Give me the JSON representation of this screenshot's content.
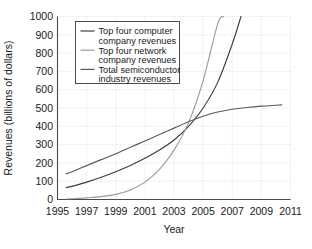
{
  "chart_data": {
    "type": "line",
    "title": "",
    "xlabel": "Year",
    "ylabel": "Revenues (billions of dollars)",
    "xlim": [
      1995,
      2011
    ],
    "ylim": [
      0,
      1000
    ],
    "xticks": [
      1995,
      1997,
      1999,
      2001,
      2003,
      2005,
      2007,
      2009,
      2011
    ],
    "yticks": [
      0,
      100,
      200,
      300,
      400,
      500,
      600,
      700,
      800,
      900,
      1000
    ],
    "xtick_labels": [
      "1995",
      "1997",
      "1999",
      "2001",
      "2003",
      "2005",
      "2007",
      "2009",
      "2011"
    ],
    "ytick_labels": [
      "0",
      "100",
      "200",
      "300",
      "400",
      "500",
      "600",
      "700",
      "800",
      "900",
      "1000"
    ],
    "grid": true,
    "legend_position": "upper-left",
    "series": [
      {
        "name": "Top four computer company revenues",
        "color": "#3d3d3d",
        "x": [
          1995.6,
          1996,
          1997,
          1998,
          1999,
          2000,
          2001,
          2002,
          2003,
          2004,
          2005,
          2006,
          2007,
          2007.6
        ],
        "values": [
          65,
          72,
          95,
          122,
          152,
          186,
          225,
          270,
          325,
          400,
          500,
          640,
          850,
          1000
        ]
      },
      {
        "name": "Top four network company revenues",
        "color": "#9a9a9a",
        "x": [
          1995.6,
          1996,
          1997,
          1998,
          1999,
          2000,
          2001,
          2002,
          2003,
          2004,
          2005,
          2006,
          2006.4
        ],
        "values": [
          2,
          4,
          9,
          16,
          28,
          52,
          95,
          165,
          270,
          420,
          650,
          960,
          1000
        ]
      },
      {
        "name": "Total semiconductor industry revenues",
        "color": "#5a5a5a",
        "x": [
          1995.6,
          1996,
          1997,
          1998,
          1999,
          2000,
          2001,
          2002,
          2003,
          2004,
          2005,
          2006,
          2007,
          2008,
          2009,
          2010,
          2010.4
        ],
        "values": [
          140,
          152,
          185,
          218,
          250,
          285,
          320,
          355,
          390,
          425,
          455,
          478,
          493,
          503,
          510,
          515,
          517
        ]
      }
    ]
  },
  "legend": {
    "entries": [
      {
        "line1": "Top four computer",
        "line2": "company revenues"
      },
      {
        "line1": "Top four network",
        "line2": "company revenues"
      },
      {
        "line1": "Total semiconductor",
        "line2": "industry revenues"
      }
    ]
  }
}
